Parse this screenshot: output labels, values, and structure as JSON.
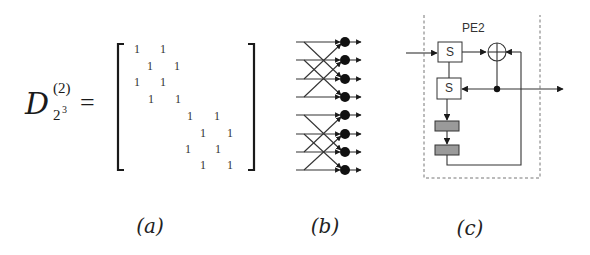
{
  "figure": {
    "panel_a": {
      "symbol": "D",
      "superscript": "(2)",
      "subscript_base": "2",
      "subscript_exp": "3",
      "equals": "=",
      "matrix_size": 8,
      "matrix_entries": [
        {
          "row": 1,
          "cols": [
            1,
            3
          ],
          "values": [
            "1",
            "1"
          ]
        },
        {
          "row": 2,
          "cols": [
            2,
            4
          ],
          "values": [
            "1",
            "1"
          ]
        },
        {
          "row": 3,
          "cols": [
            1,
            3
          ],
          "values": [
            "1",
            "1"
          ]
        },
        {
          "row": 4,
          "cols": [
            2,
            4
          ],
          "values": [
            "1",
            "1"
          ]
        },
        {
          "row": 5,
          "cols": [
            5,
            7
          ],
          "values": [
            "1",
            "1"
          ]
        },
        {
          "row": 6,
          "cols": [
            6,
            8
          ],
          "values": [
            "1",
            "1"
          ]
        },
        {
          "row": 7,
          "cols": [
            5,
            7
          ],
          "values": [
            "1",
            "1"
          ]
        },
        {
          "row": 8,
          "cols": [
            6,
            8
          ],
          "values": [
            "1",
            "1"
          ]
        }
      ],
      "caption": "(a)"
    },
    "panel_b": {
      "description": "butterfly interconnection network, two groups of 4 lines, stride-2 crossings into combining nodes",
      "groups": 2,
      "lines_per_group": 4,
      "caption": "(b)"
    },
    "panel_c": {
      "title": "PE2",
      "register_top": "S",
      "register_bottom": "S",
      "adder_symbol": "xor-adder",
      "delay_blocks": 2,
      "caption": "(c)"
    },
    "colors": {
      "ink": "#1a1a1a",
      "line": "#333333",
      "shaded_block": "#9a9a9a",
      "dashed_border": "#777777",
      "background": "#ffffff"
    }
  }
}
